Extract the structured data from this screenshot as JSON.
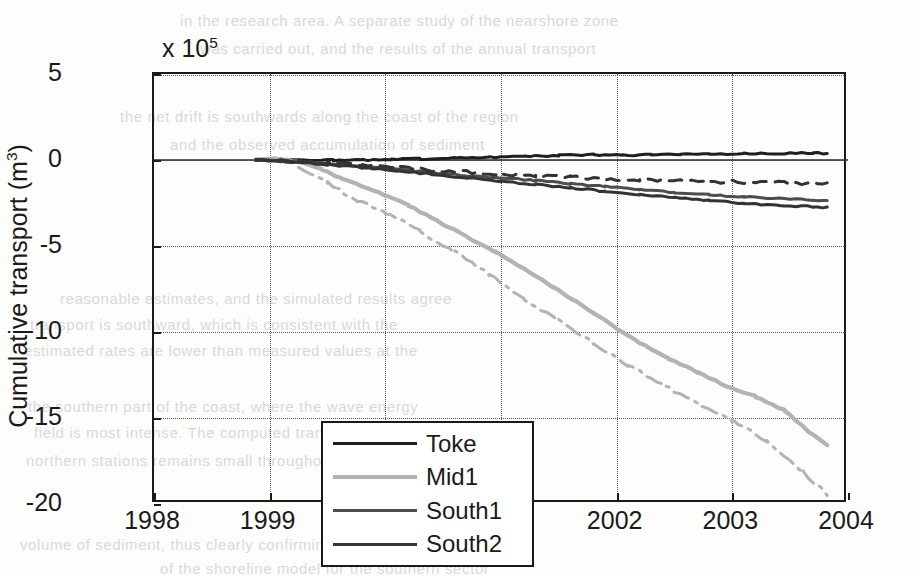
{
  "chart_data": {
    "type": "line",
    "title": "",
    "xlabel": "",
    "ylabel": "Cumulative transport (m3)",
    "ylabel_base": "Cumulative transport (m",
    "ylabel_sup": "3",
    "ylabel_tail": ")",
    "y_multiplier_prefix": "x 10",
    "y_multiplier_exp": "5",
    "y_multiplier": "x 10^5",
    "xlim": [
      1998,
      2004
    ],
    "ylim": [
      -20,
      5
    ],
    "xticks": [
      1998,
      1999,
      2000,
      2001,
      2002,
      2003,
      2004
    ],
    "xticklabels": [
      "1998",
      "1999",
      "2000",
      "2001",
      "2002",
      "2003",
      "2004"
    ],
    "yticks": [
      5,
      0,
      -5,
      -10,
      -15,
      -20
    ],
    "yticklabels": [
      "5",
      "0",
      "-5",
      "-10",
      "-15",
      "-20"
    ],
    "grid": true,
    "grid_style": "dotted",
    "legend_position": "lower left",
    "legend_entries": [
      "Toke",
      "Mid1",
      "South1",
      "South2"
    ],
    "colors": {
      "Toke": "#1f1f1f",
      "Mid1": "#b3b3b3",
      "South1": "#4d4d4d",
      "South2": "#333333",
      "axis": "#1a1a1a",
      "grid": "#5a5a5a"
    },
    "units_note": "values in 1e5 m^3",
    "series": [
      {
        "name": "Toke",
        "style": "solid",
        "color": "#1f1f1f",
        "x": [
          1998.88,
          1999.1,
          1999.3,
          1999.55,
          1999.8,
          2000.05,
          2000.3,
          2000.6,
          2000.9,
          2001.2,
          2001.5,
          2001.8,
          2002.05,
          2002.3,
          2002.55,
          2002.8,
          2003.1,
          2003.4,
          2003.7,
          2003.82
        ],
        "values": [
          0.0,
          0.02,
          0.0,
          -0.02,
          0.0,
          0.03,
          0.07,
          0.12,
          0.17,
          0.22,
          0.27,
          0.3,
          0.28,
          0.3,
          0.33,
          0.34,
          0.36,
          0.38,
          0.4,
          0.38
        ]
      },
      {
        "name": "Mid1",
        "style": "solid",
        "color": "#b3b3b3",
        "x": [
          1998.88,
          1999.05,
          1999.25,
          1999.45,
          1999.62,
          1999.8,
          2000.0,
          2000.2,
          2000.45,
          2000.7,
          2000.95,
          2001.2,
          2001.45,
          2001.7,
          2001.95,
          2002.2,
          2002.45,
          2002.7,
          2002.95,
          2003.2,
          2003.45,
          2003.65,
          2003.82
        ],
        "values": [
          0.0,
          0.05,
          -0.1,
          -0.55,
          -1.05,
          -1.55,
          -2.05,
          -2.65,
          -3.55,
          -4.45,
          -5.35,
          -6.35,
          -7.4,
          -8.45,
          -9.55,
          -10.65,
          -11.55,
          -12.35,
          -13.15,
          -13.75,
          -14.55,
          -15.75,
          -16.55
        ]
      },
      {
        "name": "Mid1-alt",
        "style": "dashdot",
        "color": "#b3b3b3",
        "x": [
          1999.25,
          1999.5,
          1999.75,
          2000.0,
          2000.3,
          2000.6,
          2000.9,
          2001.2,
          2001.5,
          2001.8,
          2002.1,
          2002.4,
          2002.7,
          2003.0,
          2003.3,
          2003.6,
          2003.82
        ],
        "values": [
          -0.35,
          -1.35,
          -2.35,
          -3.05,
          -4.15,
          -5.35,
          -6.65,
          -8.05,
          -9.35,
          -10.65,
          -11.95,
          -13.05,
          -14.15,
          -15.15,
          -16.35,
          -18.05,
          -19.45
        ]
      },
      {
        "name": "South1",
        "style": "solid",
        "color": "#4d4d4d",
        "x": [
          1998.88,
          1999.2,
          1999.5,
          1999.8,
          2000.1,
          2000.4,
          2000.7,
          2001.0,
          2001.3,
          2001.6,
          2001.9,
          2002.2,
          2002.5,
          2002.8,
          2003.1,
          2003.4,
          2003.7,
          2003.82
        ],
        "values": [
          0.0,
          -0.1,
          -0.22,
          -0.38,
          -0.55,
          -0.72,
          -0.9,
          -1.05,
          -1.2,
          -1.38,
          -1.55,
          -1.72,
          -1.88,
          -2.02,
          -2.15,
          -2.25,
          -2.32,
          -2.35
        ]
      },
      {
        "name": "South2",
        "style": "solid",
        "color": "#333333",
        "x": [
          1998.88,
          1999.2,
          1999.5,
          1999.8,
          2000.1,
          2000.4,
          2000.7,
          2001.0,
          2001.3,
          2001.6,
          2001.9,
          2002.2,
          2002.5,
          2002.8,
          2003.1,
          2003.4,
          2003.7,
          2003.82
        ],
        "values": [
          0.0,
          -0.12,
          -0.26,
          -0.44,
          -0.63,
          -0.83,
          -1.03,
          -1.22,
          -1.42,
          -1.62,
          -1.82,
          -2.0,
          -2.18,
          -2.36,
          -2.52,
          -2.64,
          -2.72,
          -2.75
        ]
      },
      {
        "name": "South-dashed",
        "style": "dashed",
        "color": "#333333",
        "x": [
          1998.88,
          1999.2,
          1999.5,
          1999.8,
          2000.1,
          2000.4,
          2000.7,
          2001.0,
          2001.3,
          2001.6,
          2001.9,
          2002.2,
          2002.5,
          2002.8,
          2003.1,
          2003.4,
          2003.7,
          2003.82
        ],
        "values": [
          0.0,
          -0.08,
          -0.18,
          -0.3,
          -0.44,
          -0.58,
          -0.7,
          -0.82,
          -0.92,
          -1.0,
          -1.08,
          -1.14,
          -1.2,
          -1.24,
          -1.28,
          -1.32,
          -1.35,
          -1.36
        ]
      }
    ]
  },
  "background_bleed": [
    {
      "text": "in the research area. A separate study of the nearshore zone",
      "x": 180,
      "y": 12
    },
    {
      "text": "was carried out, and the results of the annual transport",
      "x": 200,
      "y": 40
    },
    {
      "text": "the net drift is southwards along the coast of the region",
      "x": 120,
      "y": 108
    },
    {
      "text": "and the observed accumulation of sediment",
      "x": 170,
      "y": 136
    },
    {
      "text": "reasonable estimates, and the simulated results agree",
      "x": 60,
      "y": 290
    },
    {
      "text": "transport is southward, which is consistent with the",
      "x": 30,
      "y": 316
    },
    {
      "text": "estimated rates are lower than measured values at the",
      "x": 24,
      "y": 342
    },
    {
      "text": "the southern part of the coast, where the wave energy",
      "x": 28,
      "y": 398
    },
    {
      "text": "field is most intense. The computed transport at the",
      "x": 34,
      "y": 424
    },
    {
      "text": "northern stations remains small throughout the period",
      "x": 26,
      "y": 452
    },
    {
      "text": "volume of sediment, thus clearly confirming the predictions",
      "x": 20,
      "y": 536
    },
    {
      "text": "of the shoreline model for the southern sector",
      "x": 160,
      "y": 560
    }
  ]
}
